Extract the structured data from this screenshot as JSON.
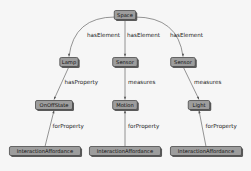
{
  "diagram": {
    "nodes": [
      {
        "id": "space",
        "label": "Space"
      },
      {
        "id": "lamp",
        "label": "Lamp"
      },
      {
        "id": "sensor1",
        "label": "Sensor"
      },
      {
        "id": "sensor2",
        "label": "Sensor"
      },
      {
        "id": "onoff",
        "label": "OnOffState"
      },
      {
        "id": "motion",
        "label": "Motion"
      },
      {
        "id": "light",
        "label": "Light"
      },
      {
        "id": "ia1",
        "label": "InteractionAffordance"
      },
      {
        "id": "ia2",
        "label": "InteractionAffordance"
      },
      {
        "id": "ia3",
        "label": "InteractionAffordance"
      }
    ],
    "edges": [
      {
        "from": "space",
        "to": "lamp",
        "label": "hasElement"
      },
      {
        "from": "space",
        "to": "sensor1",
        "label": "hasElement"
      },
      {
        "from": "space",
        "to": "sensor2",
        "label": "hasElement"
      },
      {
        "from": "lamp",
        "to": "onoff",
        "label": "hasProperty"
      },
      {
        "from": "sensor1",
        "to": "motion",
        "label": "measures"
      },
      {
        "from": "sensor2",
        "to": "light",
        "label": "measures"
      },
      {
        "from": "ia1",
        "to": "onoff",
        "label": "forProperty"
      },
      {
        "from": "ia2",
        "to": "motion",
        "label": "forProperty"
      },
      {
        "from": "ia3",
        "to": "light",
        "label": "forProperty"
      }
    ]
  }
}
